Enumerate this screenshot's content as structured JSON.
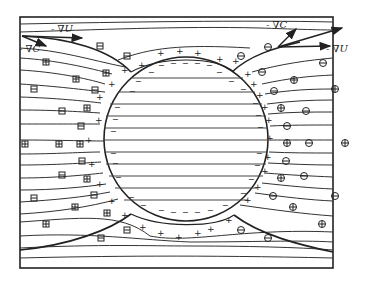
{
  "figure": {
    "frame": {
      "x": 20,
      "y": 17,
      "width": 313,
      "height": 251
    },
    "sphere": {
      "cx": 186,
      "cy": 139,
      "r": 82
    },
    "colors": {
      "ink": "#222222",
      "background": "#ffffff"
    },
    "labels": {
      "grad_u_left": "- ∇U",
      "grad_c_left": "- ∇C",
      "grad_c_right": "- ∇C",
      "grad_u_right": "- ∇U"
    },
    "symbols": {
      "surface_inner": "−",
      "surface_outer": "+",
      "left_ion": "⊟/⊞",
      "right_ion": "⊖/⊕"
    }
  }
}
